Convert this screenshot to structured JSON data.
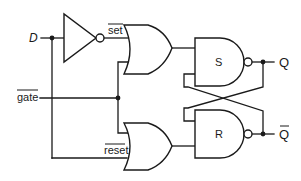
{
  "diagram": {
    "inputs": {
      "d_label": "D",
      "gate_label": "gate",
      "gate_active_low": true
    },
    "internal_signals": {
      "set_label": "set",
      "set_active_low": true,
      "reset_label": "reset",
      "reset_active_low": true
    },
    "gates": [
      {
        "id": "inverter",
        "type": "NOT",
        "label": ""
      },
      {
        "id": "or-set",
        "type": "OR",
        "label": ""
      },
      {
        "id": "or-reset",
        "type": "OR",
        "label": ""
      },
      {
        "id": "nand-s",
        "type": "NAND",
        "label": "S"
      },
      {
        "id": "nand-r",
        "type": "NAND",
        "label": "R"
      }
    ],
    "outputs": {
      "q_label": "Q",
      "qbar_label": "Q",
      "qbar_active_low": true
    },
    "colors": {
      "stroke": "#1a1a1a",
      "background": "#ffffff"
    }
  }
}
